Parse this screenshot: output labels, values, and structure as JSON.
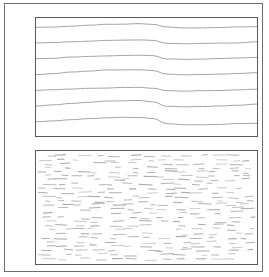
{
  "figure": {
    "background_color": "#ffffff",
    "outer_frame_color": "#6d6d6d",
    "panel_border_color": "#5a5a5a",
    "width": 269,
    "height": 277
  },
  "panels": [
    {
      "id": "top",
      "name": "continuous-grain-panel",
      "caption": "",
      "texture": "continuous-wavy-lines",
      "stroke_color": "#9a9a9a",
      "line_count": 7,
      "x": 30,
      "y": 13,
      "width": 223,
      "height": 120
    },
    {
      "id": "bottom",
      "name": "short-dash-panel",
      "caption": "",
      "texture": "short-horizontal-dashes",
      "stroke_color": "#a8a8a8",
      "dash_rows": 26,
      "dashes_per_row": 13,
      "x": 30,
      "y": 146,
      "width": 223,
      "height": 115
    }
  ],
  "chart_data": {
    "type": "line",
    "subtitle": "Seven quasi-horizontal grain lines with a single broad crest near x = 45% of panel width",
    "xlabel": "",
    "ylabel": "",
    "xlim": [
      0,
      223
    ],
    "ylim": [
      0,
      120
    ],
    "grid": false,
    "legend": "none",
    "x": [
      0,
      18,
      36,
      54,
      72,
      90,
      104,
      118,
      132,
      150,
      168,
      186,
      204,
      223
    ],
    "series": [
      {
        "name": "grain-line-1",
        "values": [
          9.5,
          9.0,
          8.2,
          7.4,
          6.6,
          6.0,
          5.8,
          6.4,
          9.4,
          10.2,
          10.0,
          9.6,
          9.2,
          8.6
        ]
      },
      {
        "name": "grain-line-2",
        "values": [
          25.5,
          25.0,
          24.2,
          23.4,
          22.8,
          22.3,
          22.1,
          22.6,
          25.6,
          26.3,
          26.0,
          25.6,
          25.1,
          24.4
        ]
      },
      {
        "name": "grain-line-3",
        "values": [
          41.5,
          40.8,
          39.9,
          39.0,
          38.4,
          38.0,
          37.9,
          38.5,
          41.4,
          42.0,
          41.7,
          41.2,
          40.6,
          39.8
        ]
      },
      {
        "name": "grain-line-4",
        "values": [
          57.5,
          56.4,
          55.0,
          53.8,
          53.0,
          52.6,
          52.6,
          53.6,
          57.2,
          57.9,
          57.6,
          57.0,
          56.3,
          55.4
        ]
      },
      {
        "name": "grain-line-5",
        "values": [
          73.5,
          72.9,
          72.2,
          71.5,
          71.0,
          70.7,
          70.7,
          71.3,
          73.8,
          74.4,
          74.1,
          73.6,
          73.0,
          72.2
        ]
      },
      {
        "name": "grain-line-6",
        "values": [
          89.5,
          88.4,
          86.9,
          85.5,
          84.5,
          84.0,
          84.0,
          85.2,
          89.6,
          90.4,
          90.1,
          89.5,
          88.8,
          87.8
        ]
      },
      {
        "name": "grain-line-7",
        "values": [
          105.5,
          104.6,
          103.4,
          102.3,
          101.5,
          101.0,
          101.0,
          102.2,
          107.6,
          108.6,
          108.4,
          108.0,
          107.5,
          106.8
        ]
      }
    ]
  }
}
